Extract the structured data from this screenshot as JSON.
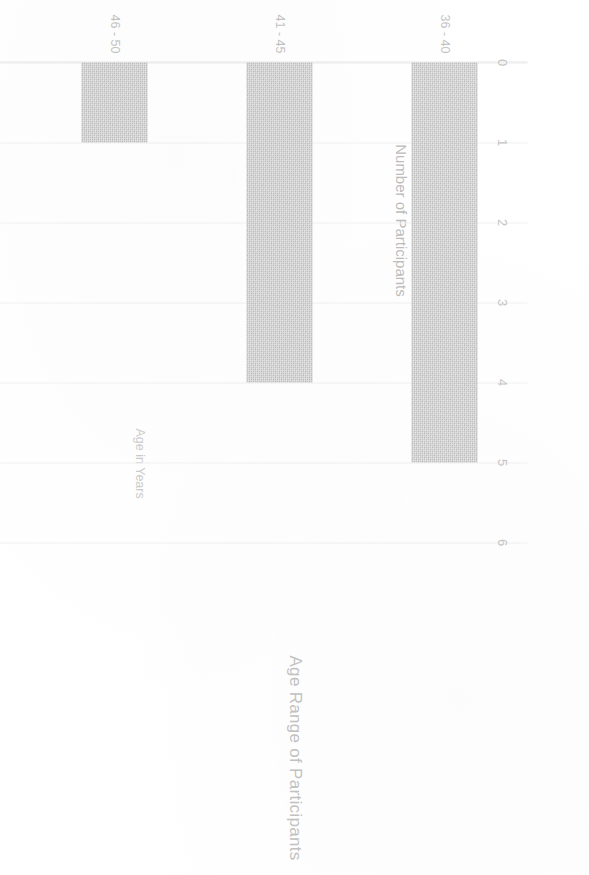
{
  "chart_data": {
    "type": "bar",
    "orientation": "vertical-rotated",
    "title": "Age Range of Participants",
    "xlabel": "Age in Years",
    "ylabel": "Number of Participants",
    "categories": [
      "36 - 40",
      "41 - 45",
      "46 - 50",
      "51 - 55",
      "56 - 60"
    ],
    "values": [
      5,
      4,
      1,
      2,
      1
    ],
    "series": [
      {
        "name": "Number of Participants",
        "values": [
          5,
          4,
          1,
          2,
          1
        ]
      }
    ],
    "value_ticks": [
      "0",
      "1",
      "2",
      "3",
      "4",
      "5",
      "6"
    ],
    "value_tick_numbers": [
      0,
      1,
      2,
      3,
      4,
      5,
      6
    ],
    "ylim": [
      0,
      6
    ],
    "grid": true,
    "legend": false,
    "bar_color": "#c9c9c9",
    "text_color": "#c2c2c2",
    "gridline_color": "#f2f2f2",
    "background": "#ffffff",
    "page_rotation_degrees": 90
  },
  "axes": {
    "value_axis_title": "Number of Participants",
    "category_axis_title": "Age in Years"
  },
  "title": "Age Range of Participants"
}
